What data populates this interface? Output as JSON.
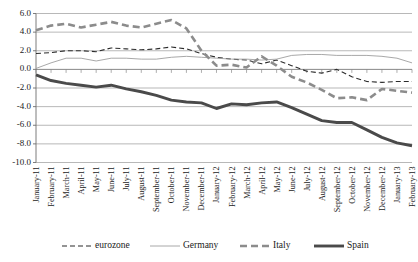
{
  "chart_data": {
    "type": "line",
    "title": "",
    "xlabel": "",
    "ylabel": "",
    "ylim": [
      -10.0,
      6.0
    ],
    "ytick_step": 2.0,
    "grid": true,
    "legend_position": "bottom",
    "yticks": [
      "6.0",
      "4.0",
      "2.0",
      "0.0",
      "-2.0",
      "-4.0",
      "-6.0",
      "-8.0",
      "-10.0"
    ],
    "ytick_values": [
      6.0,
      4.0,
      2.0,
      0.0,
      -2.0,
      -4.0,
      -6.0,
      -8.0,
      -10.0
    ],
    "categories": [
      "January-11",
      "February-11",
      "March-11",
      "April-11",
      "May-11",
      "June-11",
      "July-11",
      "August-11",
      "September-11",
      "October-11",
      "November-11",
      "December-11",
      "January-12",
      "February-12",
      "March-12",
      "April-12",
      "May-12",
      "June-12",
      "July-12",
      "August-12",
      "September-12",
      "October-12",
      "November-12",
      "December-12",
      "January-13",
      "February-13"
    ],
    "series": [
      {
        "name": "eurozone",
        "color": "#2b2b2b",
        "width": 1.1,
        "dash": "5,3",
        "values": [
          1.7,
          1.8,
          2.0,
          2.0,
          1.9,
          2.3,
          2.2,
          2.1,
          2.2,
          2.4,
          2.2,
          1.7,
          1.3,
          1.1,
          1.0,
          0.6,
          1.0,
          0.4,
          -0.2,
          -0.4,
          0.0,
          -0.8,
          -1.3,
          -1.4,
          -1.3,
          -1.3
        ]
      },
      {
        "name": "Germany",
        "color": "#9e9e9e",
        "width": 0.9,
        "dash": "none",
        "values": [
          0.1,
          0.7,
          1.2,
          1.2,
          0.9,
          1.2,
          1.2,
          1.1,
          1.1,
          1.3,
          1.4,
          1.3,
          1.2,
          1.1,
          1.1,
          1.0,
          1.1,
          1.5,
          1.6,
          1.6,
          1.5,
          1.5,
          1.5,
          1.4,
          1.2,
          0.7
        ]
      },
      {
        "name": "Italy",
        "color": "#8c8c8c",
        "width": 2.6,
        "dash": "7,4",
        "values": [
          4.2,
          4.7,
          4.9,
          4.5,
          4.8,
          5.1,
          4.7,
          4.5,
          4.9,
          5.3,
          4.4,
          2.0,
          0.4,
          0.5,
          0.2,
          1.4,
          0.4,
          -0.8,
          -1.4,
          -2.2,
          -3.1,
          -3.0,
          -3.3,
          -2.1,
          -2.3,
          -2.5
        ]
      },
      {
        "name": "Spain",
        "color": "#4a4a4a",
        "width": 2.9,
        "dash": "none",
        "values": [
          -0.6,
          -1.2,
          -1.5,
          -1.7,
          -1.9,
          -1.7,
          -2.1,
          -2.4,
          -2.8,
          -3.3,
          -3.5,
          -3.6,
          -4.2,
          -3.7,
          -3.8,
          -3.6,
          -3.5,
          -4.1,
          -4.8,
          -5.5,
          -5.7,
          -5.7,
          -6.5,
          -7.3,
          -7.9,
          -8.2
        ]
      }
    ]
  },
  "legend": {
    "items": [
      {
        "label": "eurozone"
      },
      {
        "label": "Germany"
      },
      {
        "label": "Italy"
      },
      {
        "label": "Spain"
      }
    ]
  }
}
